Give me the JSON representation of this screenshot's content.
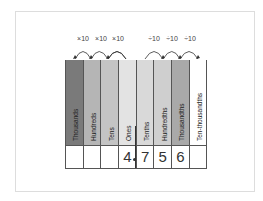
{
  "operators": {
    "left": [
      "×10",
      "×10",
      "×10"
    ],
    "right": [
      "÷10",
      "÷10",
      "÷10"
    ]
  },
  "columns": [
    {
      "label": "Thousands",
      "color": "#7a7a7a",
      "value": ""
    },
    {
      "label": "Hundreds",
      "color": "#b5b5b5",
      "value": ""
    },
    {
      "label": "Tens",
      "color": "#c4c4c4",
      "value": ""
    },
    {
      "label": "Ones",
      "color": "#e3e3e3",
      "value": "4"
    },
    {
      "label": "Tenths",
      "color": "#d9d9d9",
      "value": "7"
    },
    {
      "label": "Hundredths",
      "color": "#cfcfcf",
      "value": "5"
    },
    {
      "label": "Thousandths",
      "color": "#a9a9a9",
      "value": "6"
    },
    {
      "label": "Ten-thousandths",
      "color": "#ffffff",
      "value": ""
    }
  ],
  "number": "4.756"
}
